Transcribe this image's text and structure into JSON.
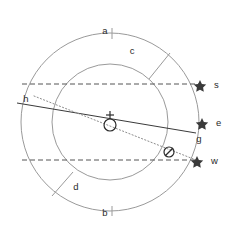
{
  "figure": {
    "background_color": "#ffffff",
    "ring_color": "#9a9a9a",
    "line_color": "#3a3a3a",
    "dash_color": "#555555",
    "dot_color": "#8c8c8c",
    "label_color": "#2b2b2b"
  },
  "geometry": {
    "center_x": 110,
    "center_y": 122,
    "outer_radius": 89,
    "inner_radius": 58
  },
  "labels": {
    "a": "a",
    "b": "b",
    "c": "c",
    "d": "d",
    "h": "h",
    "g": "g",
    "s": "s",
    "e": "e",
    "w": "w"
  },
  "markers": [
    {
      "id": "s",
      "label": "s",
      "glyph": "star",
      "x": 200,
      "y": 85
    },
    {
      "id": "e",
      "label": "e",
      "glyph": "star",
      "x": 202,
      "y": 123
    },
    {
      "id": "w",
      "label": "w",
      "glyph": "star",
      "x": 197,
      "y": 161
    }
  ],
  "symbols": [
    {
      "id": "center-body",
      "glyph": "circle-with-cross",
      "x": 110,
      "y": 124
    },
    {
      "id": "secondary-body",
      "glyph": "circle-with-slash",
      "x": 169,
      "y": 152
    }
  ],
  "lines": {
    "upper_dashed": {
      "x1": 22,
      "y1": 84,
      "x2": 199,
      "y2": 84
    },
    "lower_dashed": {
      "x1": 22,
      "y1": 160,
      "x2": 196,
      "y2": 160
    },
    "solid_chord": {
      "x1": 17,
      "y1": 103,
      "x2": 196,
      "y2": 133
    },
    "dotted_chord": {
      "x1": 34,
      "y1": 96,
      "x2": 196,
      "y2": 160
    }
  }
}
